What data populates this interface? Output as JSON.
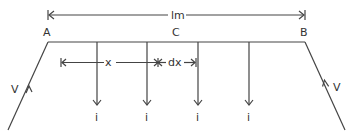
{
  "diagram": {
    "type": "transmission-line-distributed-load",
    "labels": {
      "length": "lm",
      "point_a": "A",
      "point_c": "C",
      "point_b": "B",
      "x": "x",
      "dx": "dx",
      "voltage_left": "V",
      "voltage_right": "V"
    },
    "taps": [
      {
        "label": "i"
      },
      {
        "label": "i"
      },
      {
        "label": "i"
      },
      {
        "label": "i"
      }
    ],
    "colors": {
      "line": "#444444",
      "text": "#333333",
      "background": "#ffffff"
    }
  }
}
